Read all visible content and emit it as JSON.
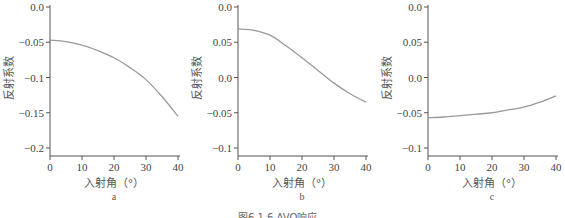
{
  "figure": {
    "caption": "图6.1.6   AVO响应"
  },
  "chart_data": [
    {
      "type": "line",
      "panel_label": "a",
      "title": "",
      "xlabel": "入射角（°）",
      "ylabel": "反射系数",
      "xlim": [
        0,
        40
      ],
      "ylim": [
        -0.21,
        0.0
      ],
      "x_ticks": [
        0,
        10,
        20,
        30,
        40
      ],
      "x_tick_labels": [
        "0",
        "10",
        "20",
        "30",
        "40"
      ],
      "y_ticks": [
        0.0,
        -0.05,
        -0.1,
        -0.15,
        -0.2
      ],
      "y_tick_labels": [
        "0.0",
        "-0.05",
        "-0.1",
        "-0.15",
        "-0.2"
      ],
      "grid": false,
      "series": [
        {
          "name": "AVO",
          "x": [
            0,
            5,
            10,
            15,
            20,
            25,
            30,
            35,
            40
          ],
          "y": [
            -0.047,
            -0.049,
            -0.054,
            -0.062,
            -0.072,
            -0.086,
            -0.103,
            -0.127,
            -0.155
          ]
        }
      ]
    },
    {
      "type": "line",
      "panel_label": "b",
      "title": "",
      "xlabel": "入射角（°）",
      "ylabel": "反射系数",
      "xlim": [
        0,
        40
      ],
      "ylim": [
        -0.11,
        0.1
      ],
      "x_ticks": [
        0,
        10,
        20,
        30,
        40
      ],
      "x_tick_labels": [
        "0",
        "10",
        "20",
        "30",
        "40"
      ],
      "y_ticks": [
        0.1,
        0.05,
        0.0,
        -0.05,
        -0.1
      ],
      "y_tick_labels": [
        "0.0",
        "0.05",
        "0.0",
        "-0.05",
        "-0.1"
      ],
      "grid": false,
      "series": [
        {
          "name": "AVO",
          "x": [
            0,
            5,
            10,
            15,
            20,
            25,
            30,
            35,
            40
          ],
          "y": [
            0.069,
            0.067,
            0.06,
            0.045,
            0.028,
            0.01,
            -0.008,
            -0.023,
            -0.035
          ]
        }
      ]
    },
    {
      "type": "line",
      "panel_label": "c",
      "title": "",
      "xlabel": "入射角（°）",
      "ylabel": "反射系数",
      "xlim": [
        0,
        40
      ],
      "ylim": [
        -0.11,
        0.1
      ],
      "x_ticks": [
        0,
        10,
        20,
        30,
        40
      ],
      "x_tick_labels": [
        "0",
        "10",
        "20",
        "30",
        "40"
      ],
      "y_ticks": [
        0.1,
        0.05,
        0.0,
        -0.05,
        -0.1
      ],
      "y_tick_labels": [
        "0.0",
        "0.05",
        "0.0",
        "-0.05",
        "-0.1"
      ],
      "grid": false,
      "series": [
        {
          "name": "AVO",
          "x": [
            0,
            5,
            10,
            15,
            20,
            25,
            30,
            35,
            40
          ],
          "y": [
            -0.057,
            -0.056,
            -0.054,
            -0.052,
            -0.05,
            -0.046,
            -0.042,
            -0.035,
            -0.026
          ]
        }
      ]
    }
  ]
}
